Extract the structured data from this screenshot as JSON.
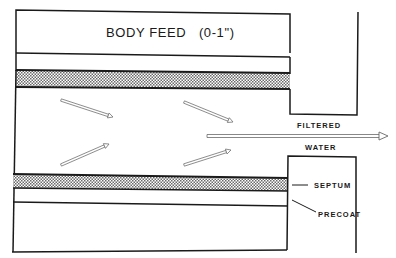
{
  "diagram": {
    "title": "BODY FEED   (0-1\")",
    "labels": {
      "filtered": "FILTERED",
      "water": "WATER",
      "septum": "SEPTUM",
      "precoat": "PRECOAT"
    },
    "flow_arrows": [
      {
        "name": "particle-arrow-upper-left",
        "direction": "down-right"
      },
      {
        "name": "particle-arrow-upper-right",
        "direction": "down-right"
      },
      {
        "name": "particle-arrow-lower-left",
        "direction": "up-right"
      },
      {
        "name": "particle-arrow-lower-right",
        "direction": "up-right"
      }
    ],
    "main_flow": {
      "name": "filtered-water-arrow",
      "direction": "right"
    },
    "colors": {
      "line": "#1a1a1a",
      "hatch_dark": "#555555",
      "hatch_light": "#ffffff",
      "arrow_fill": "#ffffff",
      "arrow_stroke": "#777777"
    }
  }
}
